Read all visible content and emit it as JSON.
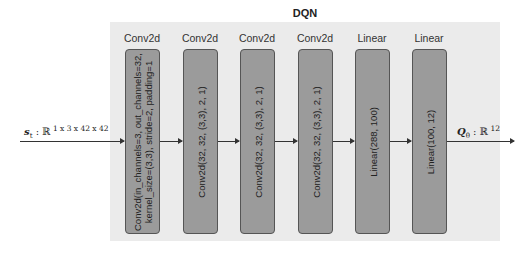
{
  "diagram": {
    "title": "DQN",
    "input": {
      "symbol": "s",
      "subscript": "t",
      "space": "ℝ",
      "dims": "1 x 3 x 42 x 42"
    },
    "output": {
      "symbol": "Q",
      "subscript": "θ",
      "space": "ℝ",
      "dims": "12"
    },
    "layers": [
      {
        "type": "Conv2d",
        "line1": "Conv2d(in_channels=3, out_channels=32,",
        "line2": "kernel_size=(3,3), stride=2, padding=1"
      },
      {
        "type": "Conv2d",
        "line1": "Conv2d(32, 32, (3,3), 2, 1)",
        "line2": ""
      },
      {
        "type": "Conv2d",
        "line1": "Conv2d(32, 32, (3,3), 2, 1)",
        "line2": ""
      },
      {
        "type": "Conv2d",
        "line1": "Conv2d(32, 32, (3,3), 2, 1)",
        "line2": ""
      },
      {
        "type": "Linear",
        "line1": "Linear(288, 100)",
        "line2": ""
      },
      {
        "type": "Linear",
        "line1": "Linear(100, 12)",
        "line2": ""
      }
    ],
    "colors": {
      "panel": "#ebebeb",
      "box": "#9b9b9b",
      "box_border": "#555555"
    }
  }
}
